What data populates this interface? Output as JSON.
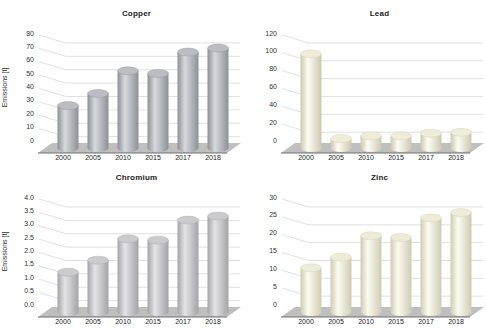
{
  "page": {
    "background": "#ffffff"
  },
  "colors": {
    "floor": "#bfbfbf",
    "floor_edge": "#6f6f6f",
    "gridline": "#d9d9d9",
    "tick_text": "#333333",
    "title_text": "#222222"
  },
  "chart_data": [
    {
      "type": "bar",
      "style": "3d-cylinder",
      "title": "Copper",
      "ylabel": "Emissions [t]",
      "xlabel": "",
      "categories": [
        "2000",
        "2005",
        "2010",
        "2015",
        "2017",
        "2018"
      ],
      "values": [
        28,
        37,
        54,
        52,
        68,
        71
      ],
      "ylim": [
        0,
        80
      ],
      "ytick_step": 10,
      "tick_decimals": 0,
      "grid": true,
      "legend": "none",
      "bar_color": {
        "edge": "#8e9096",
        "mid": "#d8d9dd",
        "top": "#bcbdc3"
      }
    },
    {
      "type": "bar",
      "style": "3d-cylinder",
      "title": "Lead",
      "ylabel": "",
      "xlabel": "",
      "categories": [
        "2000",
        "2005",
        "2010",
        "2015",
        "2017",
        "2018"
      ],
      "values": [
        100,
        5,
        8,
        8,
        11,
        12
      ],
      "ylim": [
        0,
        120
      ],
      "ytick_step": 20,
      "tick_decimals": 0,
      "grid": true,
      "legend": "none",
      "bar_color": {
        "edge": "#ccc9b0",
        "mid": "#fdfdf3",
        "top": "#efedda"
      }
    },
    {
      "type": "bar",
      "style": "3d-cylinder",
      "title": "Chromium",
      "ylabel": "Emissions [t]",
      "xlabel": "",
      "categories": [
        "2000",
        "2005",
        "2010",
        "2015",
        "2017",
        "2018"
      ],
      "values": [
        1.3,
        1.75,
        2.55,
        2.5,
        3.25,
        3.4
      ],
      "ylim": [
        0,
        4.0
      ],
      "ytick_step": 0.5,
      "tick_decimals": 1,
      "grid": true,
      "legend": "none",
      "bar_color": {
        "edge": "#a4a4a6",
        "mid": "#e4e4e6",
        "top": "#cbcbcd"
      }
    },
    {
      "type": "bar",
      "style": "3d-cylinder",
      "title": "Zinc",
      "ylabel": "",
      "xlabel": "",
      "categories": [
        "2000",
        "2005",
        "2010",
        "2015",
        "2017",
        "2018"
      ],
      "values": [
        11,
        14,
        20,
        19.5,
        25,
        26.5
      ],
      "ylim": [
        0,
        30
      ],
      "ytick_step": 5,
      "tick_decimals": 0,
      "grid": true,
      "legend": "none",
      "bar_color": {
        "edge": "#cfccb4",
        "mid": "#fcfcf0",
        "top": "#eeecd8"
      }
    }
  ]
}
